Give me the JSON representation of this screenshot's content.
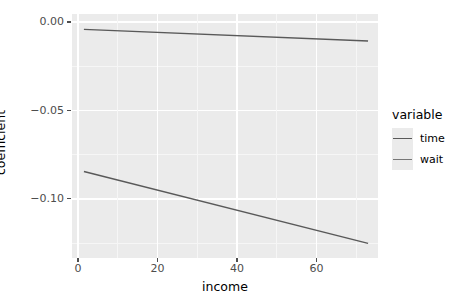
{
  "chart_data": {
    "type": "line",
    "title": "",
    "xlabel": "income",
    "ylabel": "coefficient",
    "xlim": [
      -1.5,
      75.5
    ],
    "ylim": [
      -0.1335,
      0.0045
    ],
    "xticks": [
      0,
      20,
      40,
      60
    ],
    "xtick_labels": [
      "0",
      "20",
      "40",
      "60"
    ],
    "yticks": [
      0.0,
      -0.05,
      -0.1
    ],
    "ytick_labels": [
      "0.00",
      "-0.05",
      "-0.10"
    ],
    "grid": true,
    "legend_position": "right",
    "legend_title": "variable",
    "series": [
      {
        "name": "time",
        "color": "#595959",
        "x": [
          1.5,
          73.0
        ],
        "values": [
          -0.0042,
          -0.0108
        ]
      },
      {
        "name": "wait",
        "color": "#595959",
        "x": [
          1.5,
          73.0
        ],
        "values": [
          -0.0846,
          -0.1252
        ]
      }
    ]
  },
  "axes": {
    "x_title": "income",
    "y_title": "coefficient",
    "x_ticks": [
      {
        "label": "0",
        "value": 0
      },
      {
        "label": "20",
        "value": 20
      },
      {
        "label": "40",
        "value": 40
      },
      {
        "label": "60",
        "value": 60
      }
    ],
    "y_ticks": [
      {
        "label": "0.00",
        "value": 0.0
      },
      {
        "label": "-0.05",
        "value": -0.05
      },
      {
        "label": "-0.10",
        "value": -0.1
      }
    ]
  },
  "legend": {
    "title": "variable",
    "items": [
      {
        "label": "time",
        "color": "#595959"
      },
      {
        "label": "wait",
        "color": "#777777"
      }
    ]
  },
  "style": {
    "panel_bg": "#ebebeb",
    "grid_major": "#ffffff",
    "grid_minor": "#f6f6f6",
    "line_color": "#595959",
    "text_color": "#000000",
    "tick_text_color": "#4d4d4d"
  }
}
